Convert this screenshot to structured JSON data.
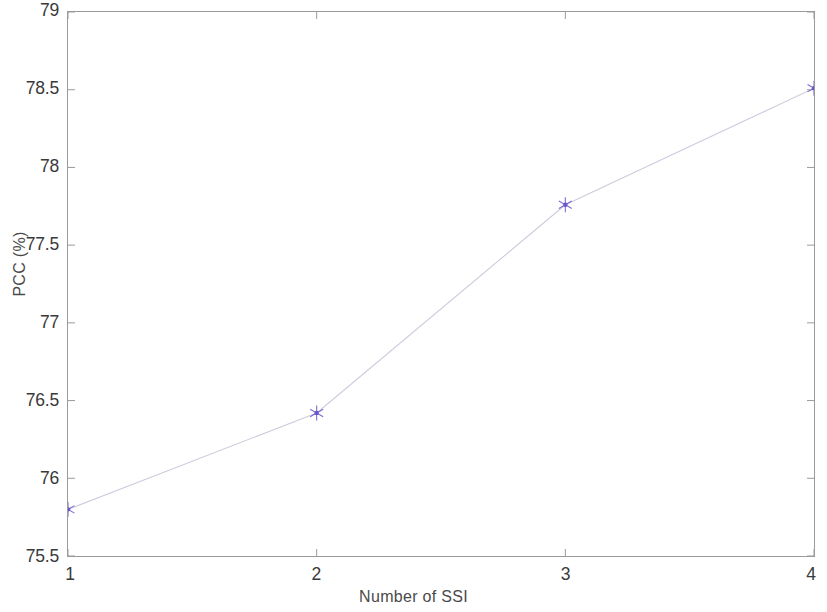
{
  "chart_data": {
    "type": "line",
    "title": "",
    "subtitle": "",
    "xlabel": "Number of SSI",
    "ylabel": "PCC (%)",
    "x": [
      1,
      2,
      3,
      4
    ],
    "values": [
      75.8,
      76.42,
      77.76,
      78.51
    ],
    "series": [
      {
        "name": "PCC",
        "x": [
          1,
          2,
          3,
          4
        ],
        "values": [
          75.8,
          76.42,
          77.76,
          78.51
        ]
      }
    ],
    "xlim": [
      1,
      4
    ],
    "ylim": [
      75.5,
      79
    ],
    "xticks": [
      "1",
      "2",
      "3",
      "4"
    ],
    "yticks": [
      "75.5",
      "76",
      "76.5",
      "77",
      "77.5",
      "78",
      "78.5",
      "79"
    ],
    "xtick_values": [
      1,
      2,
      3,
      4
    ],
    "ytick_values": [
      75.5,
      76,
      76.5,
      77,
      77.5,
      78,
      78.5,
      79
    ],
    "grid": false,
    "legend": null,
    "legend_position": "none",
    "marker": "star",
    "line_color": "#ccccdd",
    "marker_color": "#6655cc",
    "axis_color": "#9a9a9a",
    "text_color": "#3a3a3a",
    "background": "#ffffff",
    "annotations": []
  }
}
